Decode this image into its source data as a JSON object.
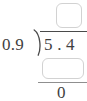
{
  "problem": {
    "type": "long-division",
    "divisor": "0.9",
    "dividend": "5 . 4",
    "remainder": "0",
    "quotient_box": {
      "value": "",
      "placeholder": ""
    },
    "partial_product_box": {
      "value": "",
      "placeholder": ""
    }
  },
  "colors": {
    "background": "#ffffff",
    "ink": "#3f3f3f",
    "rule": "#4a4a4a",
    "box_border": "#d2d2d2"
  }
}
